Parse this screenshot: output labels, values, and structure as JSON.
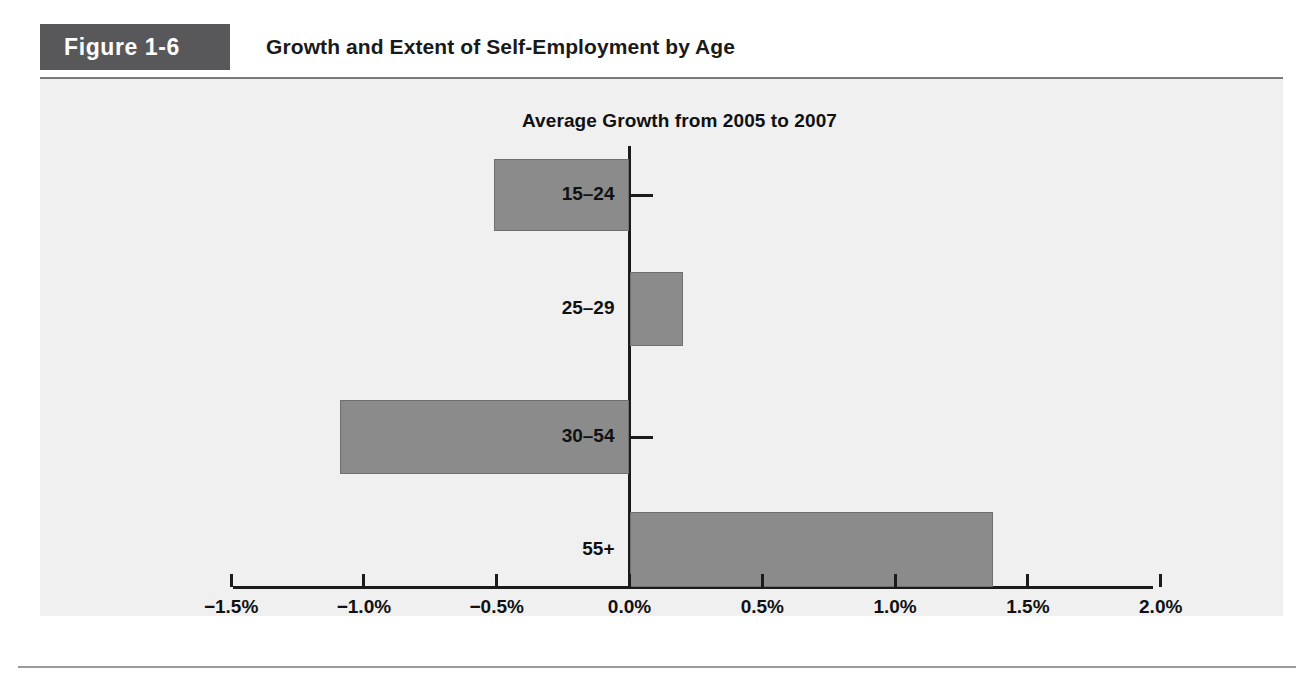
{
  "figure": {
    "tag": "Figure 1-6",
    "title": "Growth and Extent of Self-Employment by Age"
  },
  "colors": {
    "tag_background": "#58585a",
    "panel_background": "#f0f0f0",
    "bar_fill": "#8b8b8b",
    "bar_stroke": "#6f6f6f",
    "axis": "#1b1b1b",
    "text": "#111111"
  },
  "chart_data": {
    "type": "bar",
    "orientation": "horizontal",
    "title": "Average Growth from 2005 to 2007",
    "subtitle": "Average Growth from 2005 to 2007",
    "xlabel": "",
    "ylabel": "",
    "categories": [
      "15–24",
      "25–29",
      "30–54",
      "55+"
    ],
    "values": [
      -0.51,
      0.2,
      -1.09,
      1.37
    ],
    "value_unit": "%",
    "xlim": [
      -1.75,
      2.1
    ],
    "xticks": [
      -1.5,
      -1.0,
      -0.5,
      0.0,
      0.5,
      1.0,
      1.5,
      2.0
    ],
    "xticklabels": [
      "−1.5%",
      "−1.0%",
      "−0.5%",
      "0.0%",
      "0.5%",
      "1.0%",
      "1.5%",
      "2.0%"
    ],
    "grid": false,
    "legend": null,
    "legend_position": "none"
  },
  "bars": [
    {
      "label": "15–24",
      "value": -0.51
    },
    {
      "label": "25–29",
      "value": 0.2
    },
    {
      "label": "30–54",
      "value": -1.09
    },
    {
      "label": "55+",
      "value": 1.37
    }
  ],
  "xticklabels": [
    "−1.5%",
    "−1.0%",
    "−0.5%",
    "0.0%",
    "0.5%",
    "1.0%",
    "1.5%",
    "2.0%"
  ]
}
